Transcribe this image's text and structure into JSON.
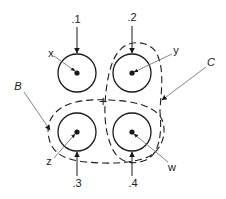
{
  "diagram": {
    "colors": {
      "stroke": "#1a1a1a",
      "leader": "#777777",
      "background": "#ffffff"
    },
    "elements": [
      {
        "id": "x",
        "label": "x",
        "number": ".1",
        "cx": 77,
        "cy": 73
      },
      {
        "id": "y",
        "label": "y",
        "number": ".2",
        "cx": 132,
        "cy": 73
      },
      {
        "id": "z",
        "label": "z",
        "number": ".3",
        "cx": 77,
        "cy": 132
      },
      {
        "id": "w",
        "label": "w",
        "number": ".4",
        "cx": 132,
        "cy": 132
      }
    ],
    "groups": [
      {
        "id": "B",
        "label": "B",
        "encloses": [
          "z",
          "w"
        ],
        "shape": "dashed-horizontal-loop"
      },
      {
        "id": "C",
        "label": "C",
        "encloses": [
          "y",
          "w"
        ],
        "shape": "dashed-vertical-loop"
      }
    ],
    "center_mark": "+"
  },
  "labels": {
    "n1": ".1",
    "n2": ".2",
    "n3": ".3",
    "n4": ".4",
    "x": "x",
    "y": "y",
    "z": "z",
    "w": "w",
    "B": "B",
    "C": "C",
    "plus": "+"
  }
}
